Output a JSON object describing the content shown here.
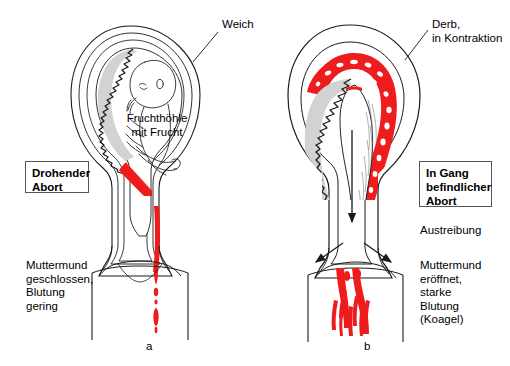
{
  "figure": {
    "type": "medical-illustration",
    "colors": {
      "blood_red": "#ee1c1c",
      "placenta_gray": "#d2d2d2",
      "outline_black": "#1a1a1a",
      "box_border": "#555555",
      "background": "#ffffff"
    }
  },
  "panels": [
    {
      "id": "a",
      "caption": "a",
      "diagnosis_box": "Drohender\nAbort",
      "wall_label": "Weich",
      "cavity_label": "Fruchthöhle\nmit Frucht",
      "findings": "Muttermund\ngeschlossen,\nBlutung\ngering"
    },
    {
      "id": "b",
      "caption": "b",
      "diagnosis_box": "In Gang\nbefindlicher\nAbort",
      "wall_label": "Derb,\nin Kontraktion",
      "process_label": "Austreibung",
      "findings": "Muttermund\neröffnet,\nstarke\nBlutung\n(Koagel)"
    }
  ]
}
